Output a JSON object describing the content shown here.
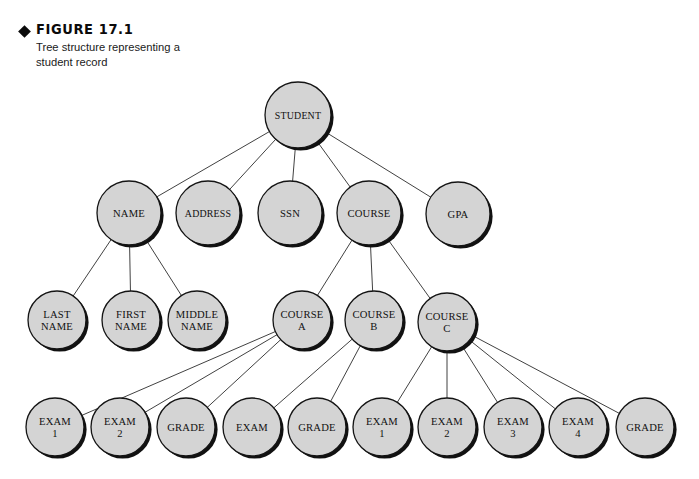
{
  "figure": {
    "bullet_icon": "diamond-bullet",
    "title": "FIGURE 17.1",
    "caption": "Tree structure representing a student record"
  },
  "colors": {
    "node_fill": "#d4d4d4",
    "node_stroke": "#141414",
    "shadow": "#111111",
    "edge": "#2b2b2b",
    "background": "#ffffff",
    "text": "#111111"
  },
  "chart_data": {
    "type": "diagram",
    "title": "Tree structure representing a student record",
    "nodes": [
      {
        "id": "student",
        "label": [
          "STUDENT"
        ],
        "cx": 298,
        "cy": 115,
        "r": 33
      },
      {
        "id": "name",
        "label": [
          "NAME"
        ],
        "cx": 129,
        "cy": 213,
        "r": 32
      },
      {
        "id": "address",
        "label": [
          "ADDRESS"
        ],
        "cx": 208,
        "cy": 213,
        "r": 32
      },
      {
        "id": "ssn",
        "label": [
          "SSN"
        ],
        "cx": 290,
        "cy": 213,
        "r": 32
      },
      {
        "id": "course",
        "label": [
          "COURSE"
        ],
        "cx": 369,
        "cy": 213,
        "r": 32
      },
      {
        "id": "gpa",
        "label": [
          "GPA"
        ],
        "cx": 458,
        "cy": 214,
        "r": 32
      },
      {
        "id": "lastname",
        "label": [
          "LAST",
          "NAME"
        ],
        "cx": 57,
        "cy": 320,
        "r": 29
      },
      {
        "id": "firstname",
        "label": [
          "FIRST",
          "NAME"
        ],
        "cx": 131,
        "cy": 320,
        "r": 29
      },
      {
        "id": "middlename",
        "label": [
          "MIDDLE",
          "NAME"
        ],
        "cx": 197,
        "cy": 320,
        "r": 29
      },
      {
        "id": "coursea",
        "label": [
          "COURSE",
          "A"
        ],
        "cx": 302,
        "cy": 320,
        "r": 29
      },
      {
        "id": "courseb",
        "label": [
          "COURSE",
          "B"
        ],
        "cx": 374,
        "cy": 320,
        "r": 29
      },
      {
        "id": "coursec",
        "label": [
          "COURSE",
          "C"
        ],
        "cx": 447,
        "cy": 322,
        "r": 29
      },
      {
        "id": "exam_a1",
        "label": [
          "EXAM",
          "1"
        ],
        "cx": 55,
        "cy": 427,
        "r": 29
      },
      {
        "id": "exam_a2",
        "label": [
          "EXAM",
          "2"
        ],
        "cx": 120,
        "cy": 427,
        "r": 29
      },
      {
        "id": "grade_a",
        "label": [
          "GRADE"
        ],
        "cx": 186,
        "cy": 427,
        "r": 29
      },
      {
        "id": "exam_b",
        "label": [
          "EXAM"
        ],
        "cx": 252,
        "cy": 427,
        "r": 29
      },
      {
        "id": "grade_b",
        "label": [
          "GRADE"
        ],
        "cx": 317,
        "cy": 427,
        "r": 29
      },
      {
        "id": "exam_c1",
        "label": [
          "EXAM",
          "1"
        ],
        "cx": 382,
        "cy": 427,
        "r": 29
      },
      {
        "id": "exam_c2",
        "label": [
          "EXAM",
          "2"
        ],
        "cx": 447,
        "cy": 427,
        "r": 29
      },
      {
        "id": "exam_c3",
        "label": [
          "EXAM",
          "3"
        ],
        "cx": 513,
        "cy": 427,
        "r": 29
      },
      {
        "id": "exam_c4",
        "label": [
          "EXAM",
          "4"
        ],
        "cx": 578,
        "cy": 427,
        "r": 29
      },
      {
        "id": "grade_c",
        "label": [
          "GRADE"
        ],
        "cx": 645,
        "cy": 427,
        "r": 29
      }
    ],
    "edges": [
      {
        "from": "student",
        "to": "name"
      },
      {
        "from": "student",
        "to": "address"
      },
      {
        "from": "student",
        "to": "ssn"
      },
      {
        "from": "student",
        "to": "course"
      },
      {
        "from": "student",
        "to": "gpa"
      },
      {
        "from": "name",
        "to": "lastname"
      },
      {
        "from": "name",
        "to": "firstname"
      },
      {
        "from": "name",
        "to": "middlename"
      },
      {
        "from": "course",
        "to": "coursea"
      },
      {
        "from": "course",
        "to": "courseb"
      },
      {
        "from": "course",
        "to": "coursec"
      },
      {
        "from": "coursea",
        "to": "exam_a1"
      },
      {
        "from": "coursea",
        "to": "exam_a2"
      },
      {
        "from": "coursea",
        "to": "grade_a"
      },
      {
        "from": "courseb",
        "to": "exam_b"
      },
      {
        "from": "courseb",
        "to": "grade_b"
      },
      {
        "from": "coursec",
        "to": "exam_c1"
      },
      {
        "from": "coursec",
        "to": "exam_c2"
      },
      {
        "from": "coursec",
        "to": "exam_c3"
      },
      {
        "from": "coursec",
        "to": "exam_c4"
      },
      {
        "from": "coursec",
        "to": "grade_c"
      }
    ]
  }
}
